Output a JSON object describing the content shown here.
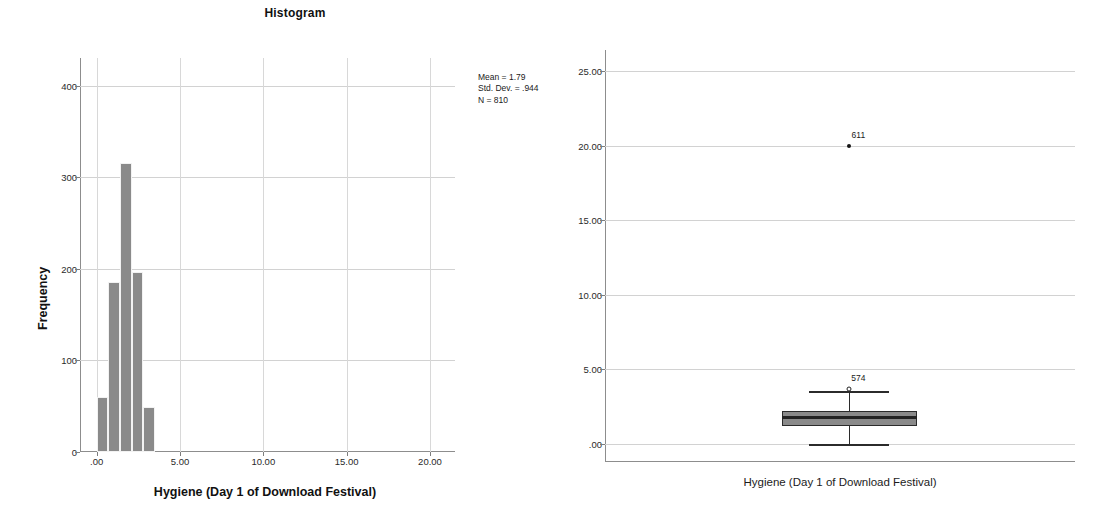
{
  "chart_data": [
    {
      "type": "bar",
      "id": "histogram",
      "title": "Histogram",
      "xlabel": "Hygiene (Day 1 of Download Festival)",
      "ylabel": "Frequency",
      "xlim": [
        -1.0,
        21.5
      ],
      "ylim": [
        0,
        430
      ],
      "grid": true,
      "x_ticks": [
        ".00",
        "5.00",
        "10.00",
        "15.00",
        "20.00"
      ],
      "x_tick_values": [
        0,
        5,
        10,
        15,
        20
      ],
      "y_ticks": [
        "0",
        "100",
        "200",
        "300",
        "400"
      ],
      "y_tick_values": [
        0,
        100,
        200,
        300,
        400
      ],
      "bin_width": 0.7,
      "bins": [
        {
          "x_left": 0.0,
          "x_right": 0.7,
          "center": 0.35,
          "value": 60
        },
        {
          "x_left": 0.7,
          "x_right": 1.4,
          "center": 1.05,
          "value": 186
        },
        {
          "x_left": 1.4,
          "x_right": 2.1,
          "center": 1.75,
          "value": 316
        },
        {
          "x_left": 2.1,
          "x_right": 2.8,
          "center": 2.45,
          "value": 197
        },
        {
          "x_left": 2.8,
          "x_right": 3.5,
          "center": 3.15,
          "value": 49
        }
      ],
      "categories": [
        "0.0-0.7",
        "0.7-1.4",
        "1.4-2.1",
        "2.1-2.8",
        "2.8-3.5"
      ],
      "values": [
        60,
        186,
        316,
        197,
        49
      ],
      "bar_color": "#8a8a8a",
      "annotations": {
        "mean_label": "Mean = 1.79",
        "std_dev_label": "Std. Dev. = .944",
        "n_label": "N = 810",
        "mean": 1.79,
        "std_dev": 0.944,
        "n": 810
      }
    },
    {
      "type": "box",
      "id": "boxplot",
      "title": "",
      "xlabel": "Hygiene (Day 1 of Download Festival)",
      "ylabel": "",
      "ylim": [
        -1.2,
        26.4
      ],
      "grid": true,
      "y_ticks": [
        ".00",
        "5.00",
        "10.00",
        "15.00",
        "20.00",
        "25.00"
      ],
      "y_tick_values": [
        0,
        5,
        10,
        15,
        20,
        25
      ],
      "box": {
        "category": "Hygiene (Day 1 of Download Festival)",
        "whisker_low": 0.0,
        "q1": 1.2,
        "median": 1.8,
        "q3": 2.2,
        "whisker_high": 3.55,
        "box_fill": "#8a8a8a",
        "box_edge": "#2b2b2b"
      },
      "outliers": [
        {
          "label": "611",
          "value": 20.0,
          "marker": "dot"
        },
        {
          "label": "574",
          "value": 3.7,
          "marker": "circle"
        }
      ]
    }
  ]
}
